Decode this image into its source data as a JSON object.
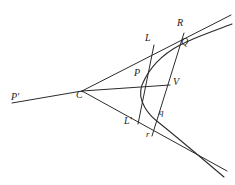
{
  "figure": {
    "type": "geometry-diagram",
    "canvas": {
      "width": 235,
      "height": 185,
      "background": "#ffffff"
    },
    "stroke_color": "#2b2b2b",
    "label_color": "#1c1c1c",
    "points": [
      {
        "id": "Pprime",
        "label": "P'",
        "x": 13,
        "y": 95,
        "label_x": 13,
        "label_y": 95
      },
      {
        "id": "C",
        "label": "C",
        "x": 82,
        "y": 91,
        "label_x": 77,
        "label_y": 95
      },
      {
        "id": "L",
        "label": "L",
        "x": 153,
        "y": 47,
        "label_x": 146,
        "label_y": 38
      },
      {
        "id": "R",
        "label": "R",
        "x": 183,
        "y": 35,
        "label_x": 178,
        "label_y": 23
      },
      {
        "id": "Q",
        "label": "Q",
        "x": 180,
        "y": 45,
        "label_x": 180,
        "label_y": 41
      },
      {
        "id": "P",
        "label": "P",
        "x": 142,
        "y": 85,
        "label_x": 135,
        "label_y": 72
      },
      {
        "id": "V",
        "label": "V",
        "x": 170,
        "y": 85,
        "label_x": 173,
        "label_y": 80
      },
      {
        "id": "q",
        "label": "q",
        "x": 158,
        "y": 120,
        "label_x": 159,
        "label_y": 112
      },
      {
        "id": "Lprime",
        "label": "L'",
        "x": 138,
        "y": 123,
        "label_x": 126,
        "label_y": 119
      },
      {
        "id": "r",
        "label": "r",
        "x": 152,
        "y": 134,
        "label_x": 146,
        "label_y": 134
      }
    ],
    "segments": [
      {
        "id": "upper-asymptote",
        "from": "C",
        "to": "beyond-R",
        "description": "asymptote from C through L and R to upper right edge"
      },
      {
        "id": "lower-asymptote",
        "from": "C",
        "to": "beyond-r",
        "description": "asymptote from C through L' and r to lower right edge"
      },
      {
        "id": "diameter-line",
        "from": "P-prime",
        "to": "V",
        "description": "straight line P' through C, P and V"
      },
      {
        "id": "ordinate-L-Lprime",
        "from": "L",
        "to": "Lprime",
        "description": "transversal through L, P and L'"
      },
      {
        "id": "ordinate-R-r",
        "from": "R",
        "to": "r",
        "description": "transversal through R, Q, V and r"
      }
    ],
    "curves": [
      {
        "id": "conic-branch",
        "through": [
          "R-side",
          "Q",
          "P",
          "q",
          "lower-right"
        ],
        "description": "hyperbola branch passing through Q, P and q"
      }
    ],
    "labels": [
      "P'",
      "C",
      "L",
      "R",
      "Q",
      "P",
      "V",
      "q",
      "L'",
      "r"
    ]
  }
}
